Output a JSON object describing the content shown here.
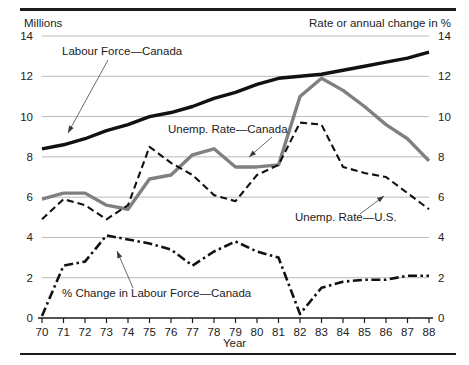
{
  "axes": {
    "left_caption": "Millions",
    "right_caption": "Rate or annual change in %",
    "xlabel": "Year",
    "y_ticks": [
      "0",
      "2",
      "4",
      "6",
      "8",
      "10",
      "12",
      "14"
    ],
    "x_ticks": [
      "70",
      "71",
      "72",
      "73",
      "74",
      "75",
      "76",
      "77",
      "78",
      "79",
      "80",
      "81",
      "82",
      "83",
      "84",
      "85",
      "86",
      "87",
      "88"
    ]
  },
  "annotations": {
    "labour_force": "Labour Force—Canada",
    "unemp_canada": "Unemp. Rate—Canada",
    "unemp_us": "Unemp. Rate—U.S.",
    "pct_change": "% Change in Labour Force—Canada"
  },
  "colors": {
    "labour_force": "#111111",
    "unemp_canada": "#808080",
    "unemp_us": "#111111",
    "pct_change": "#111111",
    "grid": "#b9b9b9",
    "axis": "#1b1b1b"
  },
  "chart_data": {
    "type": "line",
    "title": "",
    "subtitle": "",
    "xlabel": "Year",
    "ylabel": "Millions",
    "y2label": "Rate or annual change in %",
    "ylim": [
      0,
      14
    ],
    "y2lim": [
      0,
      14
    ],
    "xlim": [
      70,
      88
    ],
    "grid": true,
    "legend": "annotations-inline",
    "x": [
      70,
      71,
      72,
      73,
      74,
      75,
      76,
      77,
      78,
      79,
      80,
      81,
      82,
      83,
      84,
      85,
      86,
      87,
      88
    ],
    "series": [
      {
        "name": "Labour Force—Canada",
        "axis": "left",
        "units": "millions",
        "style": "solid-thick-black",
        "values": [
          8.4,
          8.6,
          8.9,
          9.3,
          9.6,
          10.0,
          10.2,
          10.5,
          10.9,
          11.2,
          11.6,
          11.9,
          12.0,
          12.1,
          12.3,
          12.5,
          12.7,
          12.9,
          13.2
        ]
      },
      {
        "name": "Unemp. Rate—Canada",
        "axis": "right",
        "units": "percent",
        "style": "solid-thick-gray",
        "values": [
          5.9,
          6.2,
          6.2,
          5.6,
          5.4,
          6.9,
          7.1,
          8.1,
          8.4,
          7.5,
          7.5,
          7.6,
          11.0,
          11.9,
          11.3,
          10.5,
          9.6,
          8.9,
          7.8
        ]
      },
      {
        "name": "Unemp. Rate—U.S.",
        "axis": "right",
        "units": "percent",
        "style": "dashed-black",
        "values": [
          4.9,
          5.9,
          5.6,
          4.9,
          5.6,
          8.5,
          7.7,
          7.1,
          6.1,
          5.8,
          7.1,
          7.6,
          9.7,
          9.6,
          7.5,
          7.2,
          7.0,
          6.2,
          5.4
        ]
      },
      {
        "name": "% Change in Labour Force—Canada",
        "axis": "right",
        "units": "percent",
        "style": "dash-dot-black",
        "values": [
          0.1,
          2.6,
          2.8,
          4.1,
          3.9,
          3.7,
          3.4,
          2.6,
          3.3,
          3.8,
          3.3,
          3.0,
          0.2,
          1.5,
          1.8,
          1.9,
          1.9,
          2.1,
          2.1
        ]
      }
    ]
  }
}
